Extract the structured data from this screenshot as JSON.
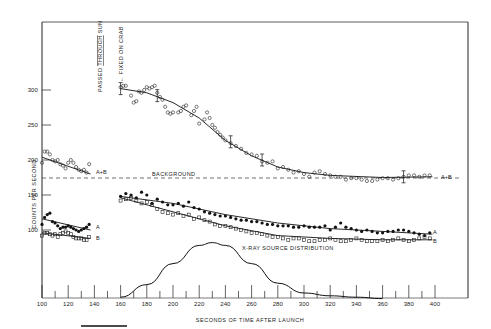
{
  "chart_data": {
    "type": "scatter",
    "title": "",
    "xlabel": "SECONDS OF TIME AFTER LAUNCH",
    "ylabel": "COUNTS PER SECOND",
    "xlim": [
      100,
      400
    ],
    "ylim": [
      0,
      350
    ],
    "x_ticks": [
      100,
      120,
      140,
      160,
      180,
      200,
      220,
      240,
      260,
      280,
      300,
      320,
      340,
      360,
      380,
      400
    ],
    "y_ticks": [
      100,
      150,
      200,
      250,
      300
    ],
    "grid": false,
    "annotations": [
      {
        "text": "PASSED THROUGH SUN",
        "x": 141,
        "orientation": "vertical"
      },
      {
        "text": "← FIXED ON CRAB",
        "x": 160,
        "orientation": "vertical"
      },
      {
        "text": "BACKGROUND",
        "x": 190,
        "y": 176
      },
      {
        "text": "X-RAY SOURCE DISTRIBUTION",
        "x": 240,
        "y": 85
      }
    ],
    "background_level": 174,
    "series": [
      {
        "name": "A+B (before)",
        "label": "A+B",
        "marker": "open-circle",
        "x": [
          100,
          102,
          104,
          106,
          108,
          110,
          112,
          114,
          116,
          118,
          120,
          122,
          124,
          126,
          128,
          130,
          132,
          134,
          136
        ],
        "values": [
          196,
          212,
          212,
          208,
          200,
          198,
          200,
          194,
          192,
          188,
          196,
          200,
          196,
          190,
          186,
          184,
          186,
          182,
          194
        ],
        "fit": [
          [
            100,
            204
          ],
          [
            137,
            180
          ]
        ]
      },
      {
        "name": "A (before)",
        "label": "A",
        "marker": "filled-circle",
        "x": [
          100,
          102,
          104,
          106,
          108,
          110,
          112,
          114,
          116,
          118,
          120,
          122,
          124,
          126,
          128,
          130,
          132,
          134,
          136
        ],
        "values": [
          108,
          118,
          122,
          124,
          112,
          110,
          106,
          102,
          104,
          104,
          106,
          104,
          102,
          100,
          98,
          100,
          102,
          104,
          108
        ],
        "fit": [
          [
            100,
            116
          ],
          [
            137,
            100
          ]
        ]
      },
      {
        "name": "B (before)",
        "label": "B",
        "marker": "open-square",
        "x": [
          100,
          102,
          104,
          106,
          108,
          110,
          112,
          114,
          116,
          118,
          120,
          122,
          124,
          126,
          128,
          130,
          132,
          134,
          136
        ],
        "values": [
          92,
          96,
          96,
          94,
          92,
          94,
          90,
          94,
          96,
          98,
          96,
          94,
          90,
          88,
          88,
          88,
          86,
          86,
          90
        ],
        "fit": [
          [
            100,
            96
          ],
          [
            137,
            88
          ]
        ]
      },
      {
        "name": "A+B (after)",
        "label": "A+B",
        "marker": "open-circle",
        "x": [
          160,
          162,
          164,
          168,
          170,
          172,
          174,
          176,
          178,
          180,
          182,
          184,
          186,
          188,
          190,
          192,
          194,
          196,
          198,
          200,
          204,
          206,
          208,
          210,
          214,
          216,
          218,
          220,
          224,
          226,
          228,
          230,
          232,
          234,
          236,
          238,
          240,
          244,
          248,
          252,
          256,
          260,
          264,
          268,
          272,
          276,
          280,
          284,
          288,
          292,
          296,
          300,
          304,
          308,
          312,
          316,
          320,
          324,
          328,
          332,
          336,
          340,
          344,
          348,
          352,
          356,
          360,
          364,
          368,
          372,
          376,
          380,
          384,
          388,
          392,
          396
        ],
        "values": [
          304,
          306,
          306,
          292,
          282,
          284,
          298,
          296,
          300,
          304,
          302,
          304,
          306,
          296,
          290,
          286,
          276,
          268,
          266,
          268,
          268,
          270,
          276,
          278,
          264,
          270,
          276,
          252,
          258,
          268,
          260,
          250,
          246,
          240,
          236,
          232,
          228,
          224,
          220,
          216,
          210,
          208,
          206,
          198,
          196,
          198,
          188,
          190,
          186,
          182,
          184,
          180,
          176,
          182,
          184,
          180,
          178,
          176,
          176,
          172,
          174,
          174,
          172,
          170,
          170,
          172,
          174,
          174,
          172,
          174,
          176,
          178,
          178,
          176,
          178,
          178
        ],
        "fit": [
          [
            160,
            302
          ],
          [
            180,
            296
          ],
          [
            200,
            282
          ],
          [
            220,
            260
          ],
          [
            240,
            228
          ],
          [
            260,
            206
          ],
          [
            280,
            190
          ],
          [
            300,
            182
          ],
          [
            320,
            178
          ],
          [
            360,
            175
          ],
          [
            398,
            176
          ]
        ]
      },
      {
        "name": "A (after)",
        "label": "A",
        "marker": "filled-circle",
        "x": [
          160,
          164,
          168,
          172,
          176,
          180,
          184,
          188,
          192,
          196,
          200,
          204,
          208,
          212,
          216,
          220,
          224,
          228,
          232,
          236,
          240,
          244,
          248,
          252,
          256,
          260,
          264,
          268,
          272,
          276,
          280,
          284,
          288,
          292,
          296,
          300,
          304,
          308,
          312,
          316,
          320,
          324,
          328,
          332,
          336,
          340,
          344,
          348,
          352,
          356,
          360,
          364,
          368,
          372,
          376,
          380,
          384,
          388,
          392,
          396
        ],
        "values": [
          148,
          152,
          150,
          146,
          154,
          150,
          138,
          144,
          140,
          136,
          136,
          138,
          134,
          140,
          132,
          130,
          126,
          124,
          122,
          120,
          120,
          118,
          116,
          114,
          114,
          112,
          112,
          110,
          108,
          108,
          106,
          106,
          106,
          104,
          104,
          106,
          104,
          104,
          104,
          106,
          100,
          104,
          110,
          104,
          102,
          100,
          98,
          100,
          98,
          96,
          96,
          98,
          98,
          100,
          100,
          98,
          96,
          94,
          92,
          96
        ],
        "fit": [
          [
            160,
            148
          ],
          [
            200,
            138
          ],
          [
            240,
            122
          ],
          [
            280,
            110
          ],
          [
            320,
            102
          ],
          [
            360,
            98
          ],
          [
            398,
            94
          ]
        ]
      },
      {
        "name": "B (after)",
        "label": "B",
        "marker": "open-square",
        "x": [
          160,
          164,
          168,
          172,
          176,
          180,
          184,
          188,
          192,
          196,
          200,
          204,
          208,
          212,
          216,
          220,
          224,
          228,
          232,
          236,
          240,
          244,
          248,
          252,
          256,
          260,
          264,
          268,
          272,
          276,
          280,
          284,
          288,
          292,
          296,
          300,
          304,
          308,
          312,
          316,
          320,
          324,
          328,
          332,
          336,
          340,
          344,
          348,
          352,
          356,
          360,
          364,
          368,
          372,
          376,
          380,
          384,
          388,
          392,
          396
        ],
        "values": [
          142,
          144,
          146,
          142,
          138,
          140,
          136,
          130,
          126,
          124,
          122,
          124,
          120,
          122,
          116,
          118,
          114,
          112,
          108,
          106,
          106,
          104,
          102,
          100,
          98,
          96,
          96,
          94,
          92,
          90,
          90,
          88,
          86,
          88,
          88,
          86,
          84,
          84,
          86,
          86,
          88,
          86,
          84,
          84,
          86,
          88,
          86,
          84,
          84,
          84,
          86,
          84,
          86,
          88,
          86,
          84,
          86,
          88,
          90,
          88
        ],
        "fit": [
          [
            160,
            146
          ],
          [
            200,
            126
          ],
          [
            240,
            106
          ],
          [
            280,
            92
          ],
          [
            320,
            88
          ],
          [
            360,
            86
          ],
          [
            398,
            86
          ]
        ]
      },
      {
        "name": "X-RAY SOURCE DISTRIBUTION",
        "marker": "none",
        "x": [
          160,
          180,
          200,
          220,
          230,
          240,
          260,
          280,
          300,
          320,
          340,
          360
        ],
        "values": [
          4,
          22,
          52,
          78,
          82,
          78,
          52,
          24,
          10,
          6,
          4,
          2
        ]
      }
    ]
  },
  "labels": {
    "ylabel": "COUNTS PER SECOND",
    "xlabel": "SECONDS OF TIME AFTER LAUNCH",
    "annot_sun_a": "PASSED ",
    "annot_sun_b": "THROUGH",
    "annot_sun_c": " SUN",
    "annot_crab": "← FIXED ON CRAB",
    "background": "BACKGROUND",
    "source_dist": "X-RAY SOURCE DISTRIBUTION",
    "label_ab": "A+B",
    "label_a": "A",
    "label_b": "B",
    "xticks": [
      "100",
      "120",
      "140",
      "160",
      "180",
      "200",
      "220",
      "240",
      "260",
      "280",
      "300",
      "320",
      "340",
      "360",
      "380",
      "400"
    ],
    "yticks": [
      "100",
      "150",
      "200",
      "250",
      "300"
    ]
  }
}
